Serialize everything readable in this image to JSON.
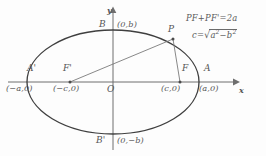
{
  "figure": {
    "type": "ellipse-geometry-diagram",
    "background_color": "#fdfdfd",
    "ink_color": "#555555",
    "curve_color": "#3f3f3f"
  },
  "axes": {
    "x_label": "x",
    "y_label": "y",
    "origin_label": "O",
    "center_px": {
      "x": 113,
      "y": 82
    },
    "x_axis": {
      "start_px": 8,
      "end_px": 236,
      "y_px": 82,
      "arrow": "right"
    },
    "y_axis": {
      "start_px": 148,
      "end_px": 10,
      "x_px": 113,
      "arrow": "up"
    }
  },
  "ellipse": {
    "semi_major_px": 86,
    "semi_minor_px": 52,
    "semi_major_symbol": "a",
    "semi_minor_symbol": "b",
    "focal_distance_symbol": "c"
  },
  "points": [
    {
      "id": "A-prime",
      "name": "A'",
      "coord": "(−a,0)",
      "role": "left-vertex",
      "px": {
        "x": 28,
        "y": 82
      },
      "name_px": {
        "x": 27,
        "y": 70
      },
      "coord_px": {
        "x": 8,
        "y": 84
      }
    },
    {
      "id": "A",
      "name": "A",
      "coord": "(a,0)",
      "role": "right-vertex",
      "px": {
        "x": 199,
        "y": 82
      },
      "name_px": {
        "x": 202,
        "y": 70
      },
      "coord_px": {
        "x": 198,
        "y": 84
      }
    },
    {
      "id": "B",
      "name": "B",
      "coord": "(0,b)",
      "role": "top-vertex",
      "px": {
        "x": 113,
        "y": 30
      },
      "name_px": {
        "x": 99,
        "y": 22
      },
      "coord_px": {
        "x": 116,
        "y": 21
      }
    },
    {
      "id": "B-prime",
      "name": "B'",
      "coord": "(0,−b)",
      "role": "bottom-vertex",
      "px": {
        "x": 113,
        "y": 134
      },
      "name_px": {
        "x": 97,
        "y": 139
      },
      "coord_px": {
        "x": 116,
        "y": 138
      }
    },
    {
      "id": "F-prime",
      "name": "F'",
      "coord": "(−c,0)",
      "role": "left-focus",
      "px": {
        "x": 70,
        "y": 82
      },
      "name_px": {
        "x": 64,
        "y": 70
      },
      "coord_px": {
        "x": 55,
        "y": 84
      }
    },
    {
      "id": "F",
      "name": "F",
      "coord": "(c,0)",
      "role": "right-focus",
      "px": {
        "x": 180,
        "y": 82
      },
      "name_px": {
        "x": 182,
        "y": 70
      },
      "coord_px": {
        "x": 162,
        "y": 84
      }
    },
    {
      "id": "P",
      "name": "P",
      "coord": "",
      "role": "point-on-ellipse",
      "px": {
        "x": 173,
        "y": 39
      },
      "name_px": {
        "x": 167,
        "y": 27
      },
      "coord_px": null
    }
  ],
  "segments": [
    {
      "id": "PF-prime",
      "from": "P",
      "to": "F-prime",
      "label": "PF'"
    },
    {
      "id": "PF",
      "from": "P",
      "to": "F",
      "label": "PF"
    }
  ],
  "formulas": {
    "sum_of_distances": {
      "lhs_first": "PF",
      "plus": "+",
      "lhs_second": "PF'",
      "equals": "=",
      "rhs": "2a",
      "full_text": "PF+PF'=2a"
    },
    "focal_relation": {
      "lhs": "c",
      "equals": "=",
      "radical": "√",
      "radicand_first": "a",
      "radicand_first_exp": "2",
      "minus": "−",
      "radicand_second": "b",
      "radicand_second_exp": "2",
      "full_text": "c = √(a² − b²)"
    }
  }
}
